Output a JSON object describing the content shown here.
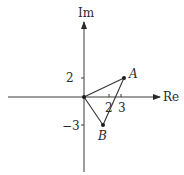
{
  "diagram": {
    "type": "complex-plane-argand",
    "axes": {
      "x_label": "Re",
      "y_label": "Im"
    },
    "ticks": {
      "x": [
        {
          "value": 2,
          "label": "2"
        },
        {
          "value": 3,
          "label": "3"
        }
      ],
      "y": [
        {
          "value": 2,
          "label": "2"
        },
        {
          "value": -3,
          "label": "−3"
        }
      ]
    },
    "points": [
      {
        "id": "O",
        "label": "",
        "re": 0,
        "im": 0
      },
      {
        "id": "A",
        "label": "A",
        "re": 3,
        "im": 2
      },
      {
        "id": "B",
        "label": "B",
        "re": 2,
        "im": -3
      }
    ],
    "edges": [
      [
        "O",
        "A"
      ],
      [
        "A",
        "B"
      ],
      [
        "B",
        "O"
      ]
    ],
    "colors": {
      "stroke": "#333333",
      "background": "#ffffff"
    }
  }
}
